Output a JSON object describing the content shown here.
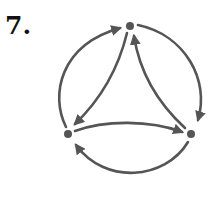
{
  "figure": {
    "label": "7.",
    "stroke_color": "#555555",
    "node_color": "#555555"
  },
  "graph": {
    "nodes": [
      {
        "id": "top",
        "x": 130,
        "y": 26
      },
      {
        "id": "left",
        "x": 68,
        "y": 134
      },
      {
        "id": "right",
        "x": 191,
        "y": 134
      }
    ],
    "edges": [
      {
        "from": "left",
        "to": "top",
        "kind": "outer-arc"
      },
      {
        "from": "top",
        "to": "right",
        "kind": "outer-arc"
      },
      {
        "from": "right",
        "to": "left",
        "kind": "outer-arc"
      },
      {
        "from": "top",
        "to": "left",
        "kind": "inner-curve"
      },
      {
        "from": "right",
        "to": "top",
        "kind": "inner-curve"
      },
      {
        "from": "left",
        "to": "right",
        "kind": "inner-curve"
      }
    ]
  }
}
